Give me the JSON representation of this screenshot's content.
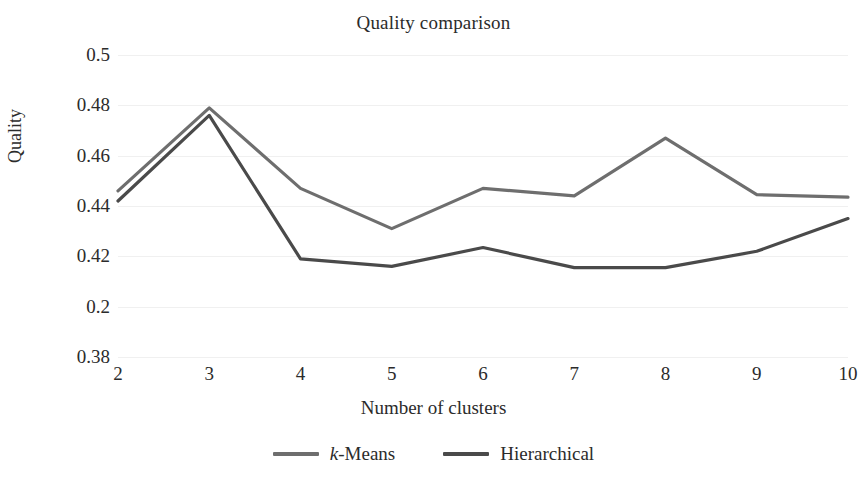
{
  "chart_data": {
    "type": "line",
    "title": "Quality comparison",
    "xlabel": "Number of clusters",
    "ylabel": "Quality",
    "categories": [
      2,
      3,
      4,
      5,
      6,
      7,
      8,
      9,
      10
    ],
    "x_tick_labels": [
      "2",
      "3",
      "4",
      "5",
      "6",
      "7",
      "8",
      "9",
      "10"
    ],
    "y_tick_labels": [
      "0.5",
      "0.48",
      "0.46",
      "0.44",
      "0.42",
      "0.2",
      "0.38"
    ],
    "y_tick_values": [
      0.5,
      0.48,
      0.46,
      0.44,
      0.42,
      0.4,
      0.38
    ],
    "ylim": [
      0.38,
      0.5
    ],
    "grid": true,
    "grid_axis": "y",
    "legend_position": "bottom",
    "series": [
      {
        "name": "k-Means",
        "label_prefix_italic": "k",
        "label_rest": "-Means",
        "color": "#6e6e6e",
        "values": [
          0.446,
          0.479,
          0.447,
          0.431,
          0.447,
          0.444,
          0.467,
          0.4445,
          0.4435
        ]
      },
      {
        "name": "Hierarchical",
        "label_prefix_italic": "",
        "label_rest": "Hierarchical",
        "color": "#4a4a4a",
        "values": [
          0.442,
          0.476,
          0.419,
          0.416,
          0.4235,
          0.4155,
          0.4155,
          0.422,
          0.435
        ]
      }
    ]
  }
}
